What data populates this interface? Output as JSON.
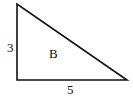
{
  "diagram": {
    "type": "right-triangle",
    "region_label": "B",
    "sides": {
      "vertical": "3",
      "horizontal": "5"
    },
    "stroke_color": "#111111",
    "fill_color": "#ffffff"
  }
}
